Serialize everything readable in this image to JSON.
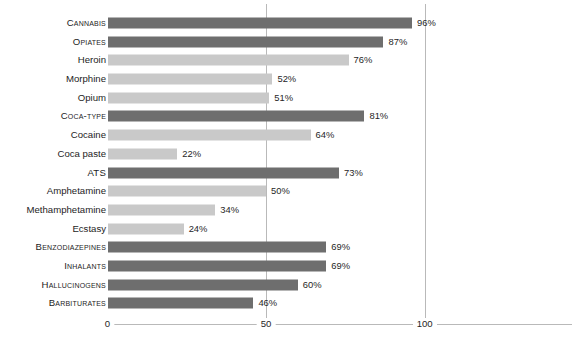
{
  "chart_data": {
    "type": "bar",
    "orientation": "horizontal",
    "title": "",
    "xlabel": "",
    "ylabel": "",
    "xlim": [
      0,
      145
    ],
    "xticks": [
      0,
      50,
      100
    ],
    "xticklabels": [
      "0",
      "50",
      "100"
    ],
    "grid": true,
    "gridlines_at": [
      50,
      100
    ],
    "legend": null,
    "value_suffix": "%",
    "categories": [
      "Cannabis",
      "Opiates",
      "Heroin",
      "Morphine",
      "Opium",
      "Coca-type",
      "Cocaine",
      "Coca paste",
      "ATS",
      "Amphetamine",
      "Methamphetamine",
      "Ecstasy",
      "Benzodiazepines",
      "Inhalants",
      "Hallucinogens",
      "Barbiturates"
    ],
    "values": [
      96,
      87,
      76,
      52,
      51,
      81,
      64,
      22,
      73,
      50,
      34,
      24,
      69,
      69,
      60,
      46
    ],
    "bars": [
      {
        "label": "Cannabis",
        "value": 96,
        "value_label": "96%",
        "level": "major",
        "color": "#6e6e6e"
      },
      {
        "label": "Opiates",
        "value": 87,
        "value_label": "87%",
        "level": "major",
        "color": "#6e6e6e"
      },
      {
        "label": "Heroin",
        "value": 76,
        "value_label": "76%",
        "level": "minor",
        "color": "#c9c9c9"
      },
      {
        "label": "Morphine",
        "value": 52,
        "value_label": "52%",
        "level": "minor",
        "color": "#c9c9c9"
      },
      {
        "label": "Opium",
        "value": 51,
        "value_label": "51%",
        "level": "minor",
        "color": "#c9c9c9"
      },
      {
        "label": "Coca-type",
        "value": 81,
        "value_label": "81%",
        "level": "major",
        "color": "#6e6e6e"
      },
      {
        "label": "Cocaine",
        "value": 64,
        "value_label": "64%",
        "level": "minor",
        "color": "#c9c9c9"
      },
      {
        "label": "Coca paste",
        "value": 22,
        "value_label": "22%",
        "level": "minor",
        "color": "#c9c9c9"
      },
      {
        "label": "ATS",
        "value": 73,
        "value_label": "73%",
        "level": "major",
        "color": "#6e6e6e"
      },
      {
        "label": "Amphetamine",
        "value": 50,
        "value_label": "50%",
        "level": "minor",
        "color": "#c9c9c9"
      },
      {
        "label": "Methamphetamine",
        "value": 34,
        "value_label": "34%",
        "level": "minor",
        "color": "#c9c9c9"
      },
      {
        "label": "Ecstasy",
        "value": 24,
        "value_label": "24%",
        "level": "minor",
        "color": "#c9c9c9"
      },
      {
        "label": "Benzodiazepines",
        "value": 69,
        "value_label": "69%",
        "level": "major",
        "color": "#6e6e6e"
      },
      {
        "label": "Inhalants",
        "value": 69,
        "value_label": "69%",
        "level": "major",
        "color": "#6e6e6e"
      },
      {
        "label": "Hallucinogens",
        "value": 60,
        "value_label": "60%",
        "level": "major",
        "color": "#6e6e6e"
      },
      {
        "label": "Barbiturates",
        "value": 46,
        "value_label": "46%",
        "level": "major",
        "color": "#6e6e6e"
      }
    ]
  },
  "colors": {
    "bar_major": "#6e6e6e",
    "bar_minor": "#c9c9c9",
    "gridline": "#b9b9b9",
    "axis": "#b9b9b9",
    "text": "#262626",
    "background": "#ffffff"
  }
}
